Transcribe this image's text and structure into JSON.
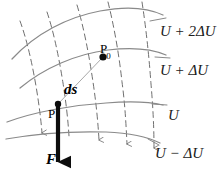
{
  "figure": {
    "colors": {
      "equipotential_curve": "#8a8a8a",
      "field_line": "#6f6f6f",
      "force_vector": "#0d0d0d",
      "ds_connector": "#a9a9a9",
      "text": "#1b1b1b",
      "background": "#ffffff"
    },
    "equipotentials": [
      {
        "id": "u-plus-2du",
        "label": "U + 2ΔU",
        "x": 160,
        "y": 24
      },
      {
        "id": "u-plus-du",
        "label": "U + ΔU",
        "x": 160,
        "y": 63
      },
      {
        "id": "u",
        "label": "U",
        "x": 168,
        "y": 108
      },
      {
        "id": "u-minus-du",
        "label": "U − ΔU",
        "x": 155,
        "y": 146
      }
    ],
    "points": [
      {
        "id": "p-zero",
        "label": "P",
        "subscript": "0",
        "x": 100,
        "y": 48
      },
      {
        "id": "p",
        "label": "P",
        "subscript": "",
        "x": 55,
        "y": 112
      }
    ],
    "vectors": [
      {
        "id": "ds-vector",
        "label": "ds",
        "x": 64,
        "y": 83
      },
      {
        "id": "f-vector",
        "label": "F",
        "x": 57,
        "y": 155
      }
    ],
    "icons": {
      "field_arrow": "arrowhead-down-icon",
      "force_arrow": "bold-arrowhead-down-icon",
      "point_marker": "filled-dot-icon"
    }
  }
}
